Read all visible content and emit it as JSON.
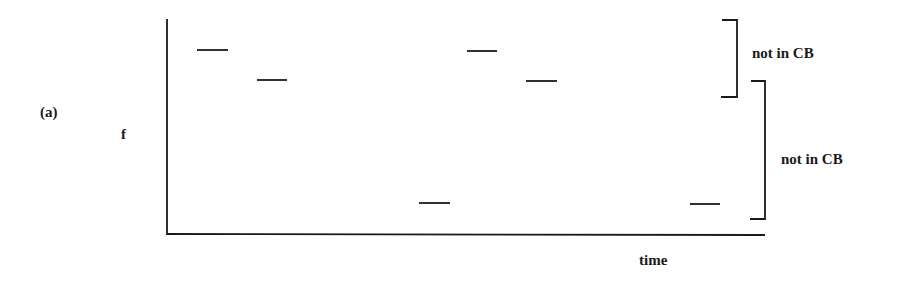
{
  "panel_label": "(a)",
  "y_axis_label": "f",
  "x_axis_label": "time",
  "brackets": [
    {
      "label": "not in CB"
    },
    {
      "label": "not in CB"
    }
  ],
  "segments_px": [
    {
      "x1": 197,
      "x2": 228,
      "y": 50
    },
    {
      "x1": 257,
      "x2": 287,
      "y": 80
    },
    {
      "x1": 467,
      "x2": 497,
      "y": 51
    },
    {
      "x1": 526,
      "x2": 557,
      "y": 81
    },
    {
      "x1": 419,
      "x2": 450,
      "y": 203
    },
    {
      "x1": 690,
      "x2": 720,
      "y": 204
    }
  ],
  "colors": {
    "ink": "#1a1a1a",
    "background": "#ffffff"
  }
}
